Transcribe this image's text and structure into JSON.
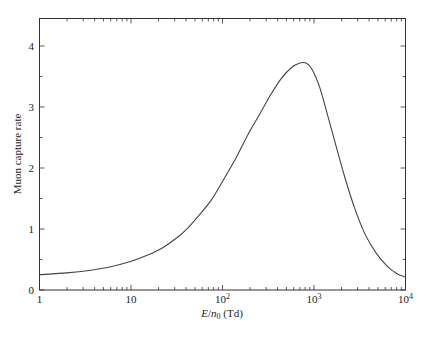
{
  "chart_data": {
    "type": "line",
    "title": "",
    "xlabel": "E/n0 (Td)",
    "xlabel_parts": {
      "E": "E",
      "slash": "/",
      "n": "n",
      "sub": "0",
      "unit": " (Td)"
    },
    "ylabel": "Muon capture rate",
    "xscale": "log",
    "xlim": [
      1,
      10000
    ],
    "ylim": [
      0,
      4.46
    ],
    "grid": false,
    "legend": null,
    "x_ticks": [
      {
        "value": 1,
        "label": "1"
      },
      {
        "value": 10,
        "label": "10"
      },
      {
        "value": 100,
        "label": "10",
        "exp": "2"
      },
      {
        "value": 1000,
        "label": "10",
        "exp": "3"
      },
      {
        "value": 10000,
        "label": "10",
        "exp": "4"
      }
    ],
    "y_ticks": [
      {
        "value": 0,
        "label": "0"
      },
      {
        "value": 1,
        "label": "1"
      },
      {
        "value": 2,
        "label": "2"
      },
      {
        "value": 3,
        "label": "3"
      },
      {
        "value": 4,
        "label": "4"
      }
    ],
    "y_minor_ticks": [
      0.5,
      1.5,
      2.5,
      3.5
    ],
    "series": [
      {
        "name": "Muon capture rate",
        "color": "#444444",
        "x": [
          1,
          2,
          3.5,
          6,
          10,
          15,
          22,
          32,
          42,
          55,
          75,
          100,
          140,
          190,
          250,
          330,
          430,
          560,
          700,
          820,
          950,
          1150,
          1400,
          1750,
          2200,
          2800,
          3600,
          4800,
          6300,
          8000,
          10000
        ],
        "y": [
          0.25,
          0.28,
          0.32,
          0.38,
          0.47,
          0.57,
          0.69,
          0.86,
          1.02,
          1.22,
          1.47,
          1.78,
          2.16,
          2.55,
          2.86,
          3.18,
          3.45,
          3.64,
          3.72,
          3.72,
          3.62,
          3.33,
          2.88,
          2.35,
          1.82,
          1.33,
          0.92,
          0.6,
          0.39,
          0.27,
          0.21
        ]
      }
    ]
  }
}
